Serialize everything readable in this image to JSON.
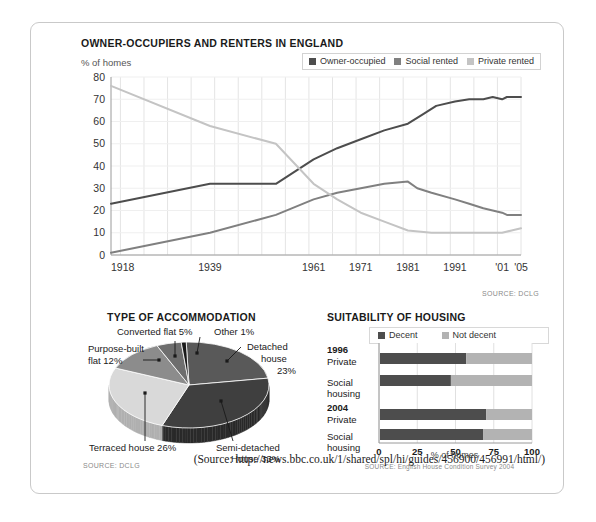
{
  "citation": "(Source: http://news.bbc.co.uk/1/shared/spl/hi/guides/456900/456991/html/)",
  "colors": {
    "owner_occupied": "#4d4d4d",
    "social_rented": "#808080",
    "private_rented": "#c4c4c4",
    "decent": "#4d4d4d",
    "not_decent": "#b3b3b3",
    "grid": "#e4e4e4",
    "axis": "#9a9a9a",
    "frame": "#c9c9c9"
  },
  "line_chart": {
    "title": "OWNER-OCCUPIERS AND RENTERS IN ENGLAND",
    "axis_title": "% of homes",
    "source": "SOURCE: DCLG",
    "legend": [
      {
        "label": "Owner-occupied",
        "color": "#4d4d4d"
      },
      {
        "label": "Social rented",
        "color": "#808080"
      },
      {
        "label": "Private rented",
        "color": "#c4c4c4"
      }
    ],
    "yticks": [
      "0",
      "10",
      "20",
      "30",
      "40",
      "50",
      "60",
      "70",
      "80"
    ],
    "xticks": [
      "1918",
      "1939",
      "1961",
      "1971",
      "1981",
      "1991",
      "'01",
      "'05"
    ]
  },
  "pie_chart": {
    "title": "TYPE OF ACCOMMODATION",
    "source": "SOURCE: DCLG",
    "labels": {
      "detached": "Detached\nhouse\n23%",
      "detached_l1": "Detached",
      "detached_l2": "house",
      "detached_l3": "23%",
      "semi_l1": "Semi-detached",
      "semi_l2": "House 33%",
      "terraced": "Terraced house 26%",
      "purpose_l1": "Purpose-built",
      "purpose_l2": "flat 12%",
      "converted": "Converted flat 5%",
      "other": "Other 1%"
    }
  },
  "bar_chart": {
    "title": "SUITABILITY OF HOUSING",
    "xlabel": "% of homes",
    "source": "SOURCE: English House Condition Survey 2004",
    "legend": [
      {
        "label": "Decent",
        "color": "#4d4d4d"
      },
      {
        "label": "Not decent",
        "color": "#b3b3b3"
      }
    ],
    "group_labels": {
      "y1996": "1996",
      "y2004": "2004",
      "private": "Private",
      "social_l1": "Social",
      "social_l2": "housing"
    },
    "xticks": [
      "0",
      "25",
      "50",
      "75",
      "100"
    ]
  },
  "chart_data": [
    {
      "type": "line",
      "title": "OWNER-OCCUPIERS AND RENTERS IN ENGLAND",
      "xlabel": "",
      "ylabel": "% of homes",
      "ylim": [
        0,
        80
      ],
      "xlim": [
        1918,
        2005
      ],
      "grid": true,
      "legend_position": "top-right",
      "source": "SOURCE: DCLG",
      "series": [
        {
          "name": "Owner-occupied",
          "color": "#4d4d4d",
          "points": [
            [
              1918,
              23
            ],
            [
              1939,
              32
            ],
            [
              1953,
              32
            ],
            [
              1961,
              43
            ],
            [
              1966,
              48
            ],
            [
              1971,
              52
            ],
            [
              1976,
              56
            ],
            [
              1981,
              59
            ],
            [
              1984,
              63
            ],
            [
              1987,
              67
            ],
            [
              1991,
              69
            ],
            [
              1994,
              70
            ],
            [
              1997,
              70
            ],
            [
              1999,
              71
            ],
            [
              2001,
              70
            ],
            [
              2002,
              71
            ],
            [
              2003,
              71
            ],
            [
              2005,
              71
            ]
          ]
        },
        {
          "name": "Social rented",
          "color": "#808080",
          "points": [
            [
              1918,
              1
            ],
            [
              1939,
              10
            ],
            [
              1953,
              18
            ],
            [
              1961,
              25
            ],
            [
              1966,
              28
            ],
            [
              1971,
              30
            ],
            [
              1976,
              32
            ],
            [
              1981,
              33
            ],
            [
              1983,
              30
            ],
            [
              1986,
              28
            ],
            [
              1991,
              25
            ],
            [
              1994,
              23
            ],
            [
              1997,
              21
            ],
            [
              1999,
              20
            ],
            [
              2001,
              19
            ],
            [
              2002,
              18
            ],
            [
              2003,
              18
            ],
            [
              2005,
              18
            ]
          ]
        },
        {
          "name": "Private rented",
          "color": "#c4c4c4",
          "points": [
            [
              1918,
              76
            ],
            [
              1939,
              58
            ],
            [
              1953,
              50
            ],
            [
              1961,
              32
            ],
            [
              1966,
              25
            ],
            [
              1971,
              19
            ],
            [
              1976,
              15
            ],
            [
              1981,
              11
            ],
            [
              1986,
              10
            ],
            [
              1991,
              10
            ],
            [
              1994,
              10
            ],
            [
              1997,
              10
            ],
            [
              1999,
              10
            ],
            [
              2001,
              10
            ],
            [
              2003,
              11
            ],
            [
              2005,
              12
            ]
          ]
        }
      ]
    },
    {
      "type": "pie",
      "title": "TYPE OF ACCOMMODATION",
      "source": "SOURCE: DCLG",
      "categories": [
        "Detached house",
        "Semi-detached House",
        "Terraced house",
        "Purpose-built flat",
        "Converted flat",
        "Other"
      ],
      "values": [
        23,
        33,
        26,
        12,
        5,
        1
      ],
      "unit": "%"
    },
    {
      "type": "bar",
      "orientation": "horizontal",
      "stacked": true,
      "title": "SUITABILITY OF HOUSING",
      "xlabel": "% of homes",
      "xlim": [
        0,
        100
      ],
      "categories": [
        "1996 Private",
        "1996 Social housing",
        "2004 Private",
        "2004 Social housing"
      ],
      "series": [
        {
          "name": "Decent",
          "color": "#4d4d4d",
          "values": [
            57,
            47,
            70,
            68
          ]
        },
        {
          "name": "Not decent",
          "color": "#b3b3b3",
          "values": [
            43,
            53,
            30,
            32
          ]
        }
      ],
      "source": "SOURCE: English House Condition Survey 2004"
    }
  ]
}
